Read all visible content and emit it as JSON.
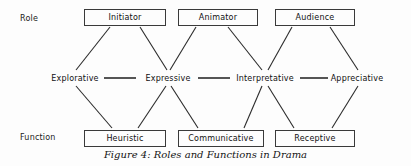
{
  "figure": {
    "caption": "Figure 4: Roles and Functions in Drama",
    "width": 411,
    "height": 166,
    "line_color": "#2b2b2b",
    "box_border_color": "#3a3a3a",
    "text_color": "#111111",
    "background_color": "#fdfdfd"
  },
  "rows": {
    "role_label": "Role",
    "function_label": "Function"
  },
  "role_nodes": [
    {
      "label": "Initiator",
      "x": 84,
      "y": 9,
      "width": 82
    },
    {
      "label": "Animator",
      "x": 178,
      "y": 9,
      "width": 80
    },
    {
      "label": "Audience",
      "x": 275,
      "y": 9,
      "width": 80
    }
  ],
  "middle_nodes": [
    {
      "label": "Explorative",
      "cx": 75,
      "y": 73
    },
    {
      "label": "Expressive",
      "cx": 168,
      "y": 73
    },
    {
      "label": "Interpretative",
      "cx": 265,
      "y": 73
    },
    {
      "label": "Appreciative",
      "cx": 357,
      "y": 73
    }
  ],
  "function_nodes": [
    {
      "label": "Heuristic",
      "x": 84,
      "y": 130,
      "width": 82
    },
    {
      "label": "Communicative",
      "x": 178,
      "y": 130,
      "width": 86
    },
    {
      "label": "Receptive",
      "x": 275,
      "y": 130,
      "width": 80
    }
  ],
  "horizontal_edges": [
    {
      "from": "Explorative",
      "to": "Expressive",
      "x1": 104,
      "x2": 136,
      "y": 78
    },
    {
      "from": "Expressive",
      "to": "Interpretative",
      "x1": 198,
      "x2": 230,
      "y": 78
    },
    {
      "from": "Interpretative",
      "to": "Appreciative",
      "x1": 300,
      "x2": 328,
      "y": 78
    }
  ],
  "diagonal_edges": [
    {
      "from": "Initiator",
      "to": "Explorative",
      "x1": 110,
      "y1": 27,
      "x2": 76,
      "y2": 70
    },
    {
      "from": "Initiator",
      "to": "Expressive",
      "x1": 140,
      "y1": 27,
      "x2": 167,
      "y2": 70
    },
    {
      "from": "Animator",
      "to": "Expressive",
      "x1": 196,
      "y1": 27,
      "x2": 170,
      "y2": 70
    },
    {
      "from": "Animator",
      "to": "Interpretative",
      "x1": 228,
      "y1": 27,
      "x2": 262,
      "y2": 70
    },
    {
      "from": "Audience",
      "to": "Interpretative",
      "x1": 292,
      "y1": 27,
      "x2": 268,
      "y2": 70
    },
    {
      "from": "Audience",
      "to": "Appreciative",
      "x1": 330,
      "y1": 27,
      "x2": 358,
      "y2": 70
    },
    {
      "from": "Explorative",
      "to": "Heuristic",
      "x1": 76,
      "y1": 86,
      "x2": 112,
      "y2": 128
    },
    {
      "from": "Expressive",
      "to": "Heuristic",
      "x1": 166,
      "y1": 86,
      "x2": 138,
      "y2": 128
    },
    {
      "from": "Expressive",
      "to": "Communicative",
      "x1": 171,
      "y1": 86,
      "x2": 198,
      "y2": 128
    },
    {
      "from": "Communicative",
      "to": "Interpretative",
      "x1": 244,
      "y1": 128,
      "x2": 262,
      "y2": 86
    },
    {
      "from": "Interpretative",
      "to": "Receptive",
      "x1": 268,
      "y1": 86,
      "x2": 294,
      "y2": 128
    },
    {
      "from": "Appreciative",
      "to": "Receptive",
      "x1": 358,
      "y1": 86,
      "x2": 332,
      "y2": 128
    }
  ]
}
